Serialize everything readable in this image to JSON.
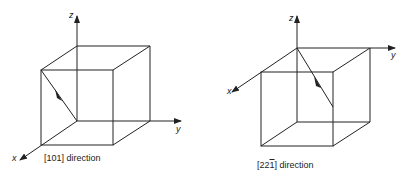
{
  "figures": [
    {
      "id": "left",
      "caption": "[101]  direction",
      "axes": {
        "x": "x",
        "y": "y",
        "z": "z"
      },
      "direction": "[101]"
    },
    {
      "id": "right",
      "caption_prefix": "[22",
      "caption_bar_digit": "1",
      "caption_suffix": "]  direction",
      "axes": {
        "x": "x",
        "y": "y",
        "z": "z"
      },
      "direction": "[2 2 -1]"
    }
  ],
  "colors": {
    "line": "#222222",
    "background": "#ffffff"
  }
}
